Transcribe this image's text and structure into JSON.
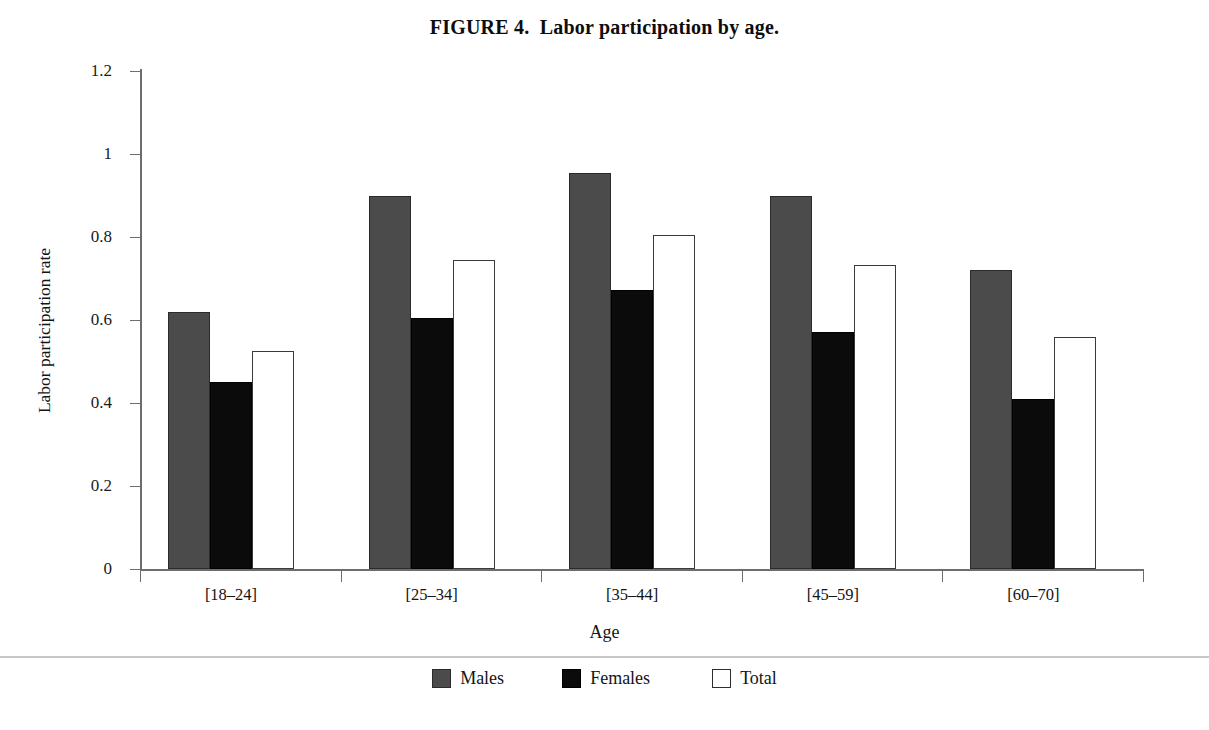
{
  "title": "FIGURE 4.  Labor participation by age.",
  "legend": {
    "position": "bottom",
    "items": [
      {
        "label": "Males",
        "swatch": "males-swatch-icon",
        "color": "#4b4b4b"
      },
      {
        "label": "Females",
        "swatch": "females-swatch-icon",
        "color": "#0b0b0b"
      },
      {
        "label": "Total",
        "swatch": "total-swatch-icon",
        "color": "#ffffff"
      }
    ]
  },
  "chart_data": {
    "type": "bar",
    "title": "FIGURE 4.  Labor participation by age.",
    "xlabel": "Age",
    "ylabel": "Labor participation rate",
    "categories": [
      "[18–24]",
      "[25–34]",
      "[35–44]",
      "[45–59]",
      "[60–70]"
    ],
    "series": [
      {
        "name": "Males",
        "color": "#4b4b4b",
        "values": [
          0.62,
          0.9,
          0.955,
          0.9,
          0.72
        ]
      },
      {
        "name": "Females",
        "color": "#0b0b0b",
        "values": [
          0.45,
          0.605,
          0.672,
          0.57,
          0.41
        ]
      },
      {
        "name": "Total",
        "color": "#ffffff",
        "values": [
          0.525,
          0.745,
          0.805,
          0.733,
          0.558
        ]
      }
    ],
    "ylim": [
      0,
      1.2
    ],
    "yticks": [
      0,
      0.2,
      0.4,
      0.6,
      0.8,
      1,
      1.2
    ],
    "ytick_labels": [
      "0",
      "0.2",
      "0.4",
      "0.6",
      "0.8",
      "1",
      "1.2"
    ],
    "grid": false,
    "legend_position": "bottom"
  }
}
